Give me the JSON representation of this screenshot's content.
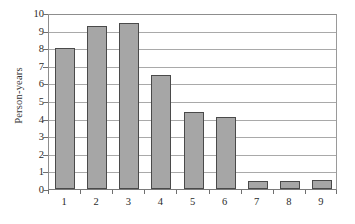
{
  "chart_data": {
    "type": "bar",
    "title": "",
    "xlabel": "",
    "ylabel": "Person-years",
    "categories": [
      "1",
      "2",
      "3",
      "4",
      "5",
      "6",
      "7",
      "8",
      "9"
    ],
    "values": [
      8.0,
      9.25,
      9.45,
      6.5,
      4.4,
      4.1,
      0.45,
      0.45,
      0.5
    ],
    "ylim": [
      0,
      10
    ],
    "yticks": [
      "0",
      "1",
      "2",
      "3",
      "4",
      "5",
      "6",
      "7",
      "8",
      "9",
      "10"
    ],
    "ytick_values": [
      0,
      1,
      2,
      3,
      4,
      5,
      6,
      7,
      8,
      9,
      10
    ],
    "grid": true,
    "legend": null,
    "series": [
      {
        "name": "Person-years",
        "values": [
          8.0,
          9.25,
          9.45,
          6.5,
          4.4,
          4.1,
          0.45,
          0.45,
          0.5
        ]
      }
    ],
    "colors": {
      "bar_fill": "#a6a6a6",
      "bar_border": "#4a4a4a",
      "gridline": "#a9a9a9",
      "axis": "#7a7a7a",
      "text": "#2b2b2b",
      "background": "#ffffff"
    }
  }
}
